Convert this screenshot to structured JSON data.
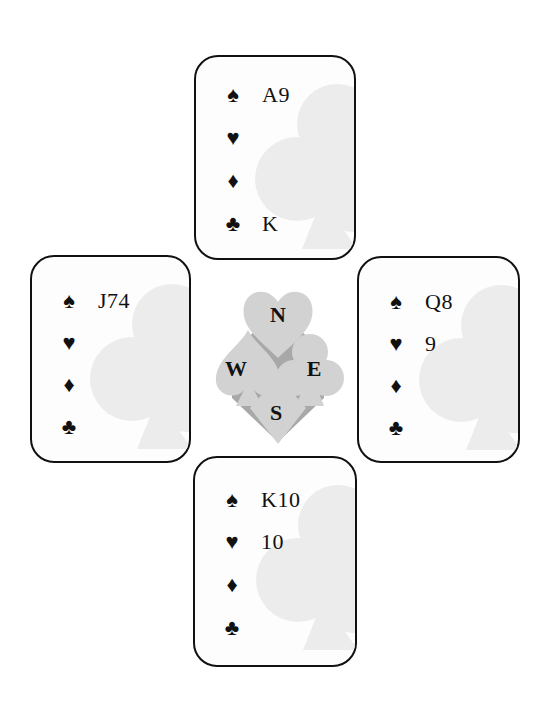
{
  "diagram": {
    "type": "bridge-hand-diagram",
    "colors": {
      "card_border": "#111111",
      "card_background": "#fdfdfd",
      "watermark": "#ececec",
      "compass_light": "#d2d2d2",
      "compass_dark": "#a8a8a8",
      "text": "#111111"
    },
    "suits": {
      "spades": "♠",
      "hearts": "♥",
      "diamonds": "♦",
      "clubs": "♣"
    },
    "compass": {
      "north": "N",
      "west": "W",
      "east": "E",
      "south": "S"
    },
    "hands": {
      "north": {
        "spades": "A9",
        "hearts": "",
        "diamonds": "",
        "clubs": "K"
      },
      "west": {
        "spades": "J74",
        "hearts": "",
        "diamonds": "",
        "clubs": ""
      },
      "east": {
        "spades": "Q8",
        "hearts": "9",
        "diamonds": "",
        "clubs": ""
      },
      "south": {
        "spades": "K10",
        "hearts": "10",
        "diamonds": "",
        "clubs": ""
      }
    }
  }
}
